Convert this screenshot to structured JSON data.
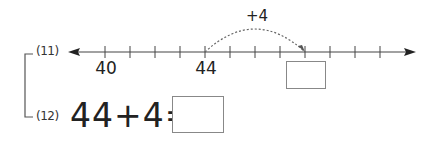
{
  "problems": [
    {
      "label": "(11)",
      "number_line": {
        "start_visible": 39,
        "tick_values": [
          39,
          40,
          41,
          42,
          43,
          44,
          45,
          46,
          47,
          48,
          49,
          50,
          51
        ],
        "labeled_ticks": [
          {
            "value": 40,
            "text": "40"
          },
          {
            "value": 44,
            "text": "44"
          }
        ],
        "jump": {
          "from": 44,
          "to": 48,
          "label": "+4"
        },
        "answer_box_at": 48,
        "answer_value": ""
      }
    },
    {
      "label": "(12)",
      "equation": {
        "left": "44",
        "op": "+",
        "right": "4",
        "equals": "=",
        "answer_value": ""
      }
    }
  ],
  "colors": {
    "line": "#444444",
    "arc": "#666666",
    "box_border": "#888888"
  }
}
